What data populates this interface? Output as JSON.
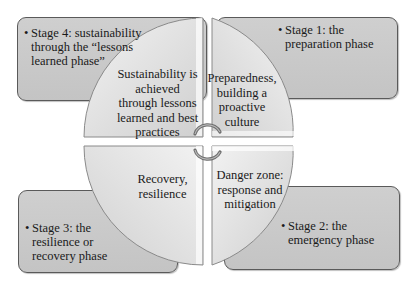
{
  "stage_boxes": [
    {
      "id": "stage4",
      "lines": [
        "Stage 4: sustainability",
        "through the “lessons",
        "learned phase”"
      ]
    },
    {
      "id": "stage1",
      "lines": [
        "Stage 1: the",
        "preparation phase"
      ]
    },
    {
      "id": "stage3",
      "lines": [
        "Stage 3: the",
        "resilience or",
        "recovery phase"
      ]
    },
    {
      "id": "stage2",
      "lines": [
        "Stage 2: the",
        "emergency phase"
      ]
    }
  ],
  "quadrants": [
    {
      "id": "top-left",
      "lines": [
        "Sustainability is",
        "achieved",
        "through lessons",
        "learned and best",
        "practices"
      ]
    },
    {
      "id": "top-right",
      "lines": [
        "Preparedness,",
        "building a",
        "proactive",
        "culture"
      ]
    },
    {
      "id": "bottom-left",
      "lines": [
        "Recovery,",
        "resilience"
      ]
    },
    {
      "id": "bottom-right",
      "lines": [
        "Danger zone:",
        "response and",
        "mitigation"
      ]
    }
  ],
  "bullet": "•",
  "center_icon": "cycle-arrows-icon",
  "colors": {
    "box_fill": "#c8c8c8",
    "box_border": "#5a5a5a",
    "quad_fill": "#dcdcdc",
    "background": "#ffffff"
  }
}
